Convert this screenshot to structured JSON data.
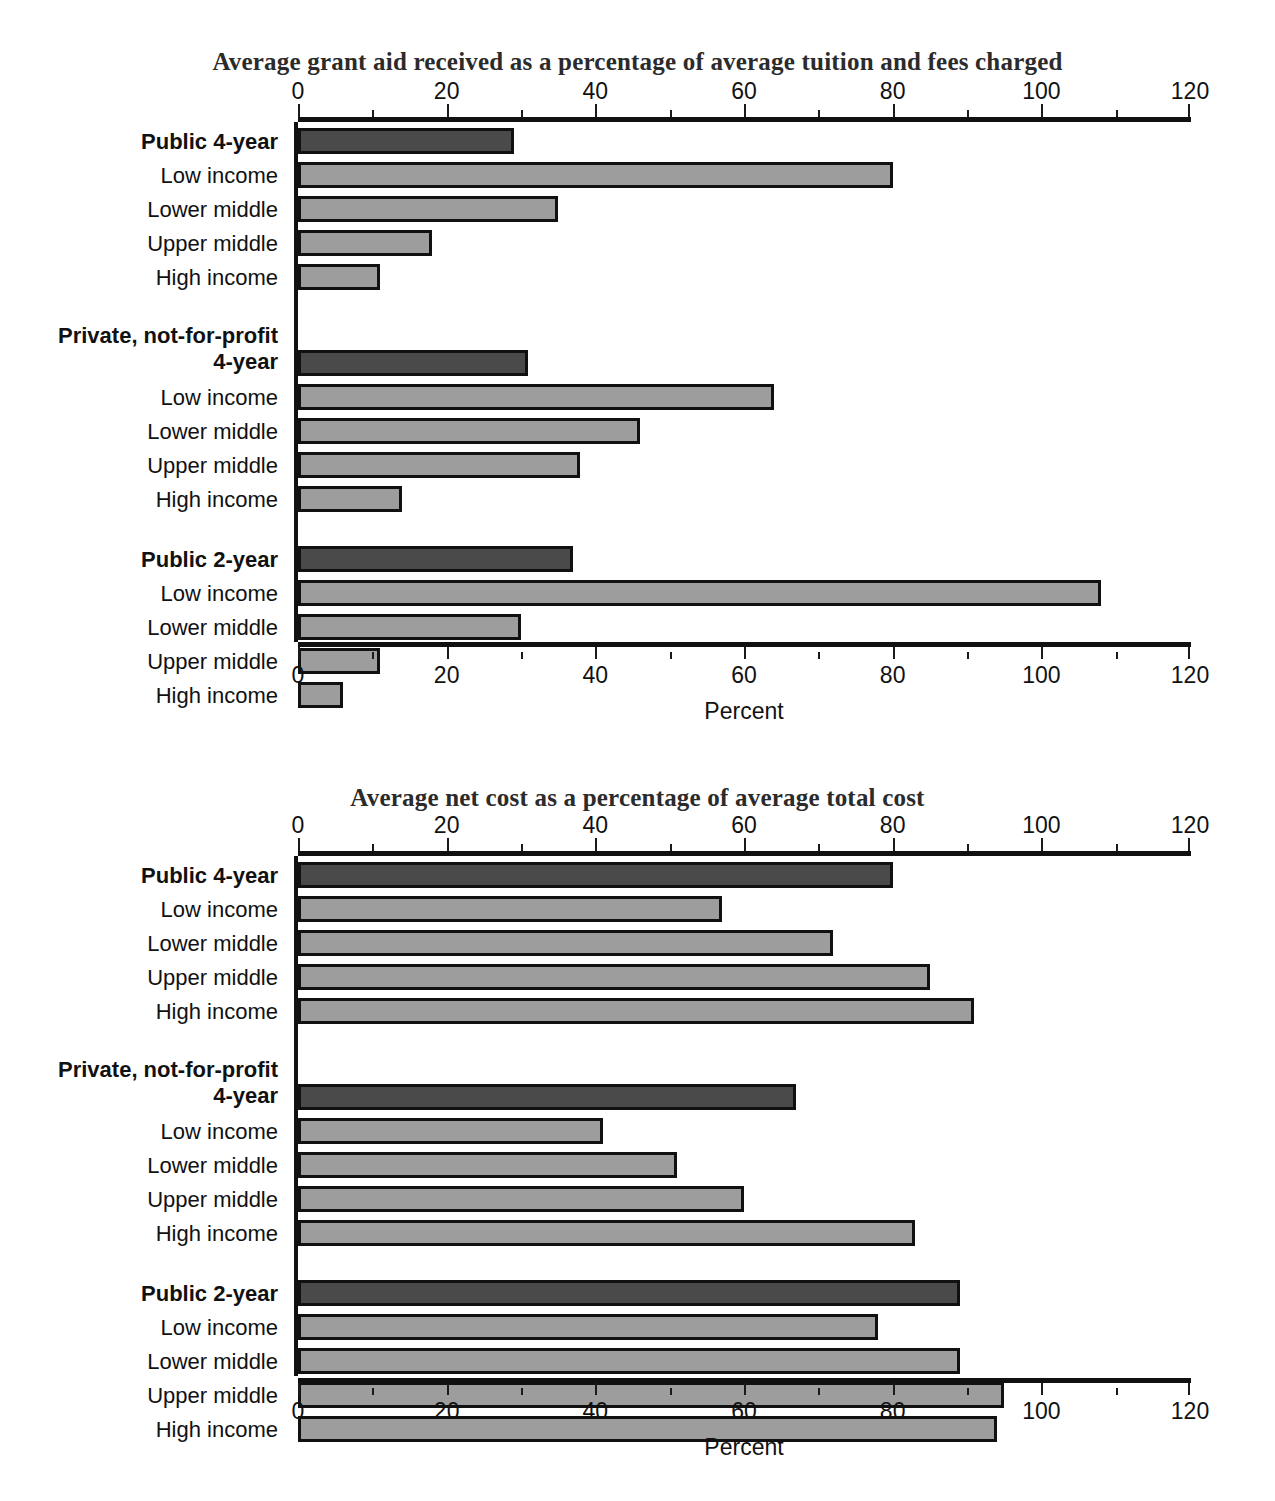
{
  "figure": {
    "axis_caption": "Percent"
  },
  "chart_data": [
    {
      "type": "bar",
      "orientation": "horizontal",
      "title": "Average grant aid received as a percentage of average tuition and fees charged",
      "xlabel": "Percent",
      "ylabel": "",
      "xlim": [
        0,
        120
      ],
      "xticks": [
        0,
        20,
        40,
        60,
        80,
        100,
        120
      ],
      "xticklabels": [
        "0",
        "20",
        "40",
        "60",
        "80",
        "100",
        "120"
      ],
      "grid": false,
      "legend": "none",
      "groups": [
        {
          "name": "Public 4-year",
          "total": {
            "label": "Public 4-year",
            "value": 29,
            "style": "total"
          },
          "items": [
            {
              "label": "Low income",
              "value": 80,
              "style": "sub"
            },
            {
              "label": "Lower middle",
              "value": 35,
              "style": "sub"
            },
            {
              "label": "Upper middle",
              "value": 18,
              "style": "sub"
            },
            {
              "label": "High income",
              "value": 11,
              "style": "sub"
            }
          ]
        },
        {
          "name": "Private, not-for-profit 4-year",
          "total": {
            "label": "Private, not-for-profit\n4-year",
            "label_line1": "Private, not-for-profit",
            "label_line2": "4-year",
            "value": 31,
            "style": "total"
          },
          "items": [
            {
              "label": "Low income",
              "value": 64,
              "style": "sub"
            },
            {
              "label": "Lower middle",
              "value": 46,
              "style": "sub"
            },
            {
              "label": "Upper middle",
              "value": 38,
              "style": "sub"
            },
            {
              "label": "High income",
              "value": 14,
              "style": "sub"
            }
          ]
        },
        {
          "name": "Public 2-year",
          "total": {
            "label": "Public 2-year",
            "value": 37,
            "style": "total"
          },
          "items": [
            {
              "label": "Low income",
              "value": 108,
              "style": "sub"
            },
            {
              "label": "Lower middle",
              "value": 30,
              "style": "sub"
            },
            {
              "label": "Upper middle",
              "value": 11,
              "style": "sub"
            },
            {
              "label": "High income",
              "value": 6,
              "style": "sub"
            }
          ]
        }
      ]
    },
    {
      "type": "bar",
      "orientation": "horizontal",
      "title": "Average net cost as a percentage of average total cost",
      "xlabel": "Percent",
      "ylabel": "",
      "xlim": [
        0,
        120
      ],
      "xticks": [
        0,
        20,
        40,
        60,
        80,
        100,
        120
      ],
      "xticklabels": [
        "0",
        "20",
        "40",
        "60",
        "80",
        "100",
        "120"
      ],
      "grid": false,
      "legend": "none",
      "groups": [
        {
          "name": "Public 4-year",
          "total": {
            "label": "Public 4-year",
            "value": 80,
            "style": "total"
          },
          "items": [
            {
              "label": "Low income",
              "value": 57,
              "style": "sub"
            },
            {
              "label": "Lower middle",
              "value": 72,
              "style": "sub"
            },
            {
              "label": "Upper middle",
              "value": 85,
              "style": "sub"
            },
            {
              "label": "High income",
              "value": 91,
              "style": "sub"
            }
          ]
        },
        {
          "name": "Private, not-for-profit 4-year",
          "total": {
            "label": "Private, not-for-profit\n4-year",
            "label_line1": "Private, not-for-profit",
            "label_line2": "4-year",
            "value": 67,
            "style": "total"
          },
          "items": [
            {
              "label": "Low income",
              "value": 41,
              "style": "sub"
            },
            {
              "label": "Lower middle",
              "value": 51,
              "style": "sub"
            },
            {
              "label": "Upper middle",
              "value": 60,
              "style": "sub"
            },
            {
              "label": "High income",
              "value": 83,
              "style": "sub"
            }
          ]
        },
        {
          "name": "Public 2-year",
          "total": {
            "label": "Public 2-year",
            "value": 89,
            "style": "total"
          },
          "items": [
            {
              "label": "Low income",
              "value": 78,
              "style": "sub"
            },
            {
              "label": "Lower middle",
              "value": 89,
              "style": "sub"
            },
            {
              "label": "Upper middle",
              "value": 95,
              "style": "sub"
            },
            {
              "label": "High income",
              "value": 94,
              "style": "sub"
            }
          ]
        }
      ]
    }
  ],
  "colors": {
    "total_bar": "#4a4a4a",
    "sub_bar": "#9d9d9d",
    "outline": "#111111",
    "title": "#2b2b2b"
  }
}
